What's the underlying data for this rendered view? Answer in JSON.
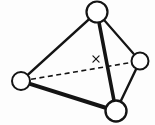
{
  "figure": {
    "background_color": "#fdfdfd",
    "stroke_color": "#141414",
    "node_fill_color": "#ffffff",
    "width": 155,
    "height": 125
  },
  "chart_data": {
    "type": "diagram",
    "subtype": "node-link-graph",
    "title": "",
    "nodes": [
      {
        "id": "top",
        "label": "",
        "cx": 97,
        "cy": 12,
        "r": 10.5,
        "stroke_width": 2.2
      },
      {
        "id": "left",
        "label": "",
        "cx": 21,
        "cy": 81,
        "r": 9.0,
        "stroke_width": 2.0
      },
      {
        "id": "right",
        "label": "",
        "cx": 140,
        "cy": 61,
        "r": 8.5,
        "stroke_width": 2.0
      },
      {
        "id": "bottom",
        "label": "",
        "cx": 116,
        "cy": 111,
        "r": 10.5,
        "stroke_width": 2.4
      }
    ],
    "edges": [
      {
        "id": "top-left",
        "from": "top",
        "to": "left",
        "style": "solid",
        "stroke_width": 2.6
      },
      {
        "id": "top-right",
        "from": "top",
        "to": "right",
        "style": "solid",
        "stroke_width": 2.2
      },
      {
        "id": "top-bottom",
        "from": "top",
        "to": "bottom",
        "style": "solid",
        "stroke_width": 3.6
      },
      {
        "id": "left-bottom",
        "from": "left",
        "to": "bottom",
        "style": "solid",
        "stroke_width": 4.0
      },
      {
        "id": "right-bottom",
        "from": "right",
        "to": "bottom",
        "style": "solid",
        "stroke_width": 2.4
      },
      {
        "id": "left-right",
        "from": "left",
        "to": "right",
        "style": "dashed",
        "stroke_width": 1.6,
        "dash_pattern": "5,3.5"
      }
    ],
    "annotations": [
      {
        "id": "x-marker",
        "text": "x",
        "x": 96,
        "y": 59,
        "size": 8
      }
    ]
  }
}
